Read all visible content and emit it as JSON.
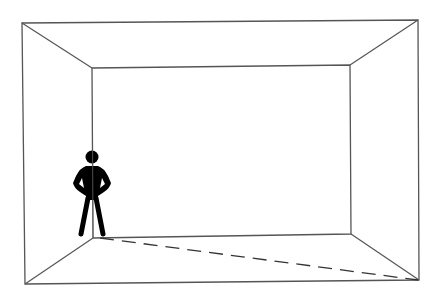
{
  "diagram": {
    "title": "",
    "description": "Line drawing of an empty room in one-point perspective with a standing human figure (hands on hips) near the back-left corner and a dashed diagonal line across the floor",
    "colors": {
      "background": "#ffffff",
      "line": "#555555",
      "figure": "#000000"
    },
    "room": {
      "outer": {
        "tl": [
          22,
          23
        ],
        "tr": [
          418,
          20
        ],
        "br": [
          419,
          280
        ],
        "bl": [
          25,
          284
        ]
      },
      "inner": {
        "tl": [
          92,
          68
        ],
        "tr": [
          350,
          65
        ],
        "br": [
          351,
          234
        ],
        "bl": [
          93,
          238
        ]
      }
    },
    "dashed_line": {
      "from": [
        100,
        238
      ],
      "to": [
        418,
        280
      ],
      "dash": "14 8"
    },
    "figure": {
      "label": "human-figure",
      "head": {
        "cx": 92,
        "cy": 157,
        "r": 6
      },
      "pose": "hands-on-hips"
    }
  }
}
